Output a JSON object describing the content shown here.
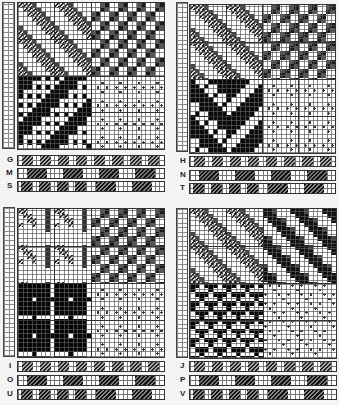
{
  "figure": {
    "colors": {
      "ink": "#111111",
      "grid_line": "#5a5a5a",
      "paper": "#ffffff",
      "background": "#f4f4f2"
    }
  },
  "panels": [
    {
      "id": "top-left",
      "quadrants": [
        {
          "position": "top-left",
          "pattern": "diagonal-twill-hatched"
        },
        {
          "position": "top-right",
          "pattern": "checker-dark-crosses"
        },
        {
          "position": "bottom-left",
          "pattern": "solid-diagonal-bands"
        },
        {
          "position": "bottom-right",
          "pattern": "light-dotted-clusters"
        }
      ],
      "strips": [
        {
          "label": "G",
          "style": "hatched-blocks"
        },
        {
          "label": "M",
          "style": "paired-blocks"
        },
        {
          "label": "S",
          "style": "mixed-blocks"
        }
      ]
    },
    {
      "id": "top-right",
      "quadrants": [
        {
          "position": "top-left",
          "pattern": "diagonal-twill-hatched"
        },
        {
          "position": "top-right",
          "pattern": "checker-dark-crosses"
        },
        {
          "position": "bottom-left",
          "pattern": "solid-zigzag-bands"
        },
        {
          "position": "bottom-right",
          "pattern": "light-dotted-clusters"
        }
      ],
      "strips": [
        {
          "label": "H",
          "style": "hatched-blocks"
        },
        {
          "label": "N",
          "style": "paired-blocks"
        },
        {
          "label": "T",
          "style": "mixed-blocks"
        }
      ]
    },
    {
      "id": "bottom-left",
      "quadrants": [
        {
          "position": "top-left",
          "pattern": "hatched-blocks-grid"
        },
        {
          "position": "top-right",
          "pattern": "checker-dark-crosses"
        },
        {
          "position": "bottom-left",
          "pattern": "solid-plaid"
        },
        {
          "position": "bottom-right",
          "pattern": "light-dotted-clusters"
        }
      ],
      "strips": [
        {
          "label": "I",
          "style": "hatched-blocks"
        },
        {
          "label": "O",
          "style": "paired-blocks"
        },
        {
          "label": "U",
          "style": "mixed-blocks"
        }
      ]
    },
    {
      "id": "bottom-right",
      "quadrants": [
        {
          "position": "top-left",
          "pattern": "diagonal-twill-hatched"
        },
        {
          "position": "top-right",
          "pattern": "diagonal-dark-bands"
        },
        {
          "position": "bottom-left",
          "pattern": "solid-interlock"
        },
        {
          "position": "bottom-right",
          "pattern": "light-diagonal-dots"
        }
      ],
      "strips": [
        {
          "label": "J",
          "style": "hatched-blocks"
        },
        {
          "label": "P",
          "style": "paired-blocks"
        },
        {
          "label": "V",
          "style": "mixed-blocks"
        }
      ]
    }
  ]
}
